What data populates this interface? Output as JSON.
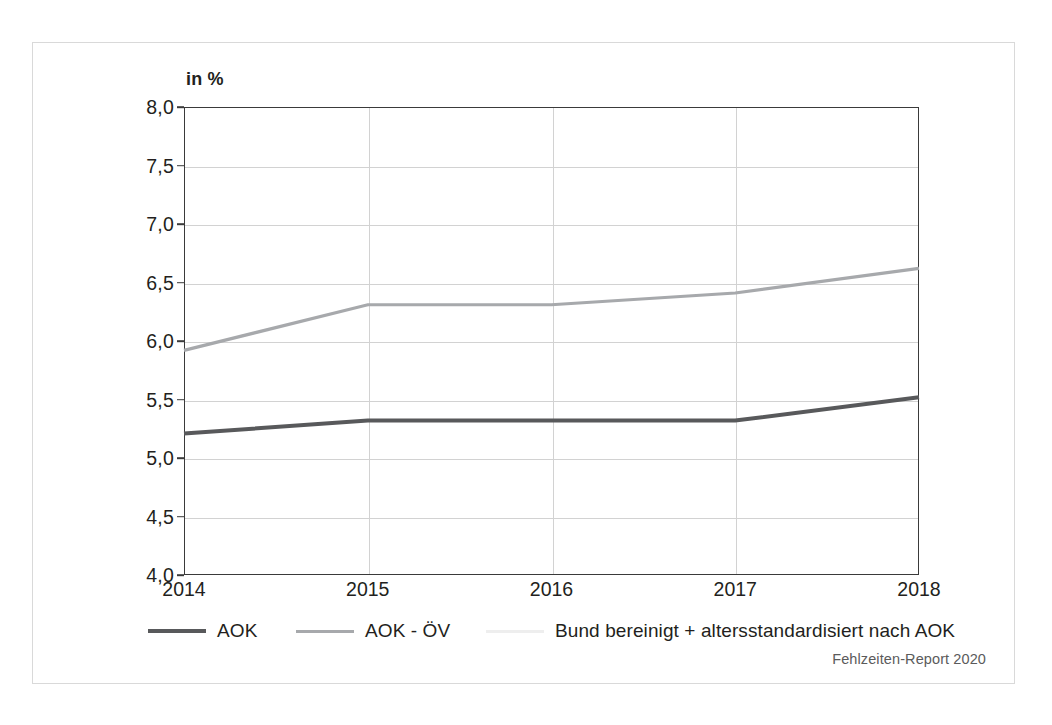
{
  "chart_data": {
    "type": "line",
    "title": "",
    "subtitle": "",
    "xlabel": "",
    "ylabel": "in %",
    "categories": [
      "2014",
      "2015",
      "2016",
      "2017",
      "2018"
    ],
    "x": [
      2014,
      2015,
      2016,
      2017,
      2018
    ],
    "series": [
      {
        "name": "AOK",
        "values": [
          5.21,
          5.32,
          5.32,
          5.32,
          5.52
        ],
        "color": "#58595b",
        "width": 4.0
      },
      {
        "name": "AOK - ÖV",
        "values": [
          5.92,
          6.31,
          6.31,
          6.41,
          6.62
        ],
        "color": "#a7a9ac",
        "width": 3.2
      }
    ],
    "ylim": [
      4.0,
      8.0
    ],
    "ytick_values": [
      8.0,
      7.5,
      7.0,
      6.5,
      6.0,
      5.5,
      5.0,
      4.5,
      4.0
    ],
    "ytick_labels": [
      "8,0",
      "7,5",
      "7,0",
      "6,5",
      "6,0",
      "5,5",
      "5,0",
      "4,5",
      "4,0"
    ],
    "grid": true,
    "grid_axis": "both",
    "legend_position": "bottom-left",
    "annotations": []
  },
  "axis": {
    "unit_label": "in %"
  },
  "legend": {
    "items": [
      {
        "label": "AOK",
        "color": "#58595b",
        "style": "thick"
      },
      {
        "label": "AOK - ÖV",
        "color": "#a7a9ac",
        "style": "thin"
      },
      {
        "label": "Bund bereinigt + altersstandardisiert nach AOK",
        "color": "#eeeeee",
        "style": "thin"
      }
    ]
  },
  "footer": {
    "attribution": "Fehlzeiten-Report 2020"
  },
  "colors": {
    "series_dark": "#58595b",
    "series_light": "#a7a9ac",
    "axis": "#3a3a3a",
    "grid": "#d2d2d2",
    "frame": "#d9d9d9",
    "text": "#231f20",
    "attribution_text": "#5b5b5b"
  }
}
